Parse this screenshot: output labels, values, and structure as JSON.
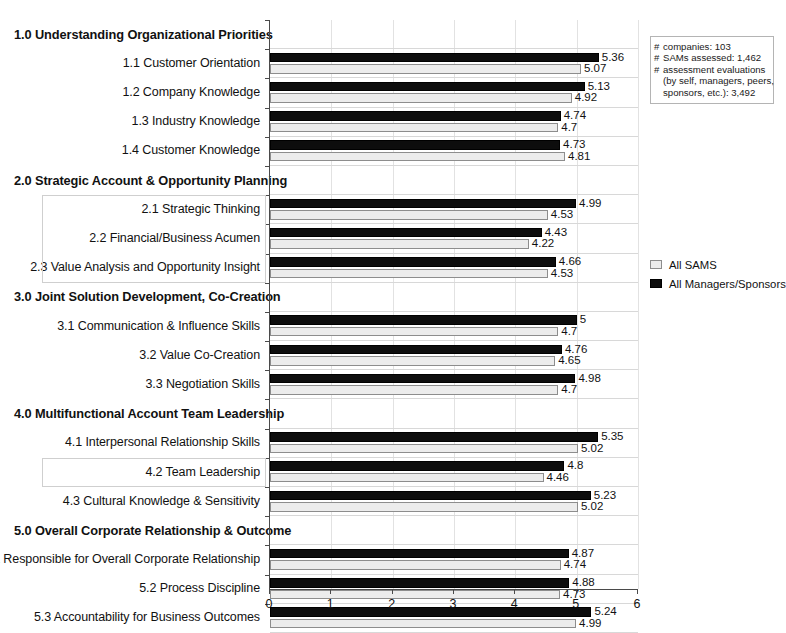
{
  "chart_data": {
    "type": "bar",
    "title": "",
    "xlabel": "",
    "ylabel": "",
    "xlim": [
      0,
      6
    ],
    "xticks": [
      0,
      1,
      2,
      3,
      4,
      5,
      6
    ],
    "grid": true,
    "orientation": "horizontal",
    "legend_position": "right",
    "series": [
      {
        "name": "All Managers/Sponsors",
        "color": "#0d0d0d",
        "values": [
          5.36,
          5.13,
          4.74,
          4.73,
          4.99,
          4.43,
          4.66,
          5,
          4.76,
          4.98,
          5.35,
          4.8,
          5.23,
          4.87,
          4.88,
          5.24
        ]
      },
      {
        "name": "All SAMS",
        "color": "#ececec",
        "values": [
          5.07,
          4.92,
          4.7,
          4.81,
          4.53,
          4.22,
          4.53,
          4.7,
          4.65,
          4.7,
          5.02,
          4.46,
          5.02,
          4.74,
          4.73,
          4.99
        ]
      }
    ],
    "categories": [
      "1.1 Customer Orientation",
      "1.2 Company Knowledge",
      "1.3 Industry Knowledge",
      "1.4 Customer Knowledge",
      "2.1 Strategic Thinking",
      "2.2 Financial/Business Acumen",
      "2.3 Value Analysis and Opportunity Insight",
      "3.1 Communication & Influence Skills",
      "3.2 Value Co-Creation",
      "3.3 Negotiation Skills",
      "4.1 Interpersonal Relationship Skills",
      "4.2 Team Leadership",
      "4.3 Cultural Knowledge & Sensitivity",
      "5.1 Responsible for Overall Corporate Relationship",
      "5.2 Process Discipline",
      "5.3 Accountability for Business Outcomes"
    ],
    "rows": [
      {
        "label": "1.0 Understanding Organizational Priorities",
        "section": true
      },
      {
        "label": "1.1 Customer Orientation",
        "section": false,
        "dark": 5.36,
        "light": 5.07,
        "dark_text": "5.36",
        "light_text": "5.07"
      },
      {
        "label": "1.2 Company Knowledge",
        "section": false,
        "dark": 5.13,
        "light": 4.92,
        "dark_text": "5.13",
        "light_text": "4.92"
      },
      {
        "label": "1.3 Industry Knowledge",
        "section": false,
        "dark": 4.74,
        "light": 4.7,
        "dark_text": "4.74",
        "light_text": "4.7"
      },
      {
        "label": "1.4 Customer Knowledge",
        "section": false,
        "dark": 4.73,
        "light": 4.81,
        "dark_text": "4.73",
        "light_text": "4.81"
      },
      {
        "label": "2.0 Strategic Account & Opportunity Planning",
        "section": true
      },
      {
        "label": "2.1 Strategic Thinking",
        "section": false,
        "dark": 4.99,
        "light": 4.53,
        "dark_text": "4.99",
        "light_text": "4.53"
      },
      {
        "label": "2.2 Financial/Business Acumen",
        "section": false,
        "dark": 4.43,
        "light": 4.22,
        "dark_text": "4.43",
        "light_text": "4.22"
      },
      {
        "label": "2.3 Value Analysis and Opportunity Insight",
        "section": false,
        "dark": 4.66,
        "light": 4.53,
        "dark_text": "4.66",
        "light_text": "4.53"
      },
      {
        "label": "3.0 Joint Solution Development, Co-Creation",
        "section": true
      },
      {
        "label": "3.1 Communication & Influence Skills",
        "section": false,
        "dark": 5,
        "light": 4.7,
        "dark_text": "5",
        "light_text": "4.7"
      },
      {
        "label": "3.2 Value Co-Creation",
        "section": false,
        "dark": 4.76,
        "light": 4.65,
        "dark_text": "4.76",
        "light_text": "4.65"
      },
      {
        "label": "3.3 Negotiation Skills",
        "section": false,
        "dark": 4.98,
        "light": 4.7,
        "dark_text": "4.98",
        "light_text": "4.7"
      },
      {
        "label": "4.0 Multifunctional Account Team Leadership",
        "section": true
      },
      {
        "label": "4.1 Interpersonal Relationship Skills",
        "section": false,
        "dark": 5.35,
        "light": 5.02,
        "dark_text": "5.35",
        "light_text": "5.02"
      },
      {
        "label": "4.2 Team Leadership",
        "section": false,
        "dark": 4.8,
        "light": 4.46,
        "dark_text": "4.8",
        "light_text": "4.46"
      },
      {
        "label": "4.3 Cultural Knowledge & Sensitivity",
        "section": false,
        "dark": 5.23,
        "light": 5.02,
        "dark_text": "5.23",
        "light_text": "5.02"
      },
      {
        "label": "5.0 Overall Corporate Relationship & Outcome",
        "section": true
      },
      {
        "label": "5.1 Responsible for Overall Corporate Relationship",
        "section": false,
        "dark": 4.87,
        "light": 4.74,
        "dark_text": "4.87",
        "light_text": "4.74"
      },
      {
        "label": "5.2 Process Discipline",
        "section": false,
        "dark": 4.88,
        "light": 4.73,
        "dark_text": "4.88",
        "light_text": "4.73"
      },
      {
        "label": "5.3 Accountability for Business Outcomes",
        "section": false,
        "dark": 5.24,
        "light": 4.99,
        "dark_text": "5.24",
        "light_text": "4.99"
      }
    ]
  },
  "legend": {
    "items": [
      {
        "label": "All SAMS",
        "swatch": "light"
      },
      {
        "label": "All Managers/Sponsors",
        "swatch": "dark"
      }
    ]
  },
  "info_box": {
    "lines": [
      {
        "hash": "#",
        "text": "companies: 103"
      },
      {
        "hash": "#",
        "text": "SAMs assessed: 1,462"
      },
      {
        "hash": "#",
        "text": "assessment evaluations"
      },
      {
        "hash": "",
        "text": "(by self, managers, peers,"
      },
      {
        "hash": "",
        "text": "sponsors, etc.): 3,492"
      }
    ]
  },
  "xaxis": {
    "ticks": [
      "0",
      "1",
      "2",
      "3",
      "4",
      "5",
      "6"
    ]
  }
}
